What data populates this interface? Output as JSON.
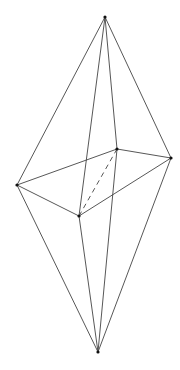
{
  "figure": {
    "type": "octahedron-wireframe",
    "stroke_color": "#444444",
    "vertex_color": "#111111",
    "vertices": {
      "top": [
        105,
        17
      ],
      "left": [
        17,
        185
      ],
      "back": [
        117,
        149
      ],
      "right": [
        171,
        158
      ],
      "front": [
        79,
        216
      ],
      "bottom": [
        98,
        352
      ]
    },
    "edges_visible": [
      [
        "top",
        "left"
      ],
      [
        "top",
        "back"
      ],
      [
        "top",
        "right"
      ],
      [
        "top",
        "front"
      ],
      [
        "bottom",
        "left"
      ],
      [
        "bottom",
        "back"
      ],
      [
        "bottom",
        "right"
      ],
      [
        "bottom",
        "front"
      ],
      [
        "left",
        "back"
      ],
      [
        "back",
        "right"
      ],
      [
        "right",
        "front"
      ],
      [
        "front",
        "left"
      ]
    ],
    "edges_hidden": [
      [
        "back",
        "front"
      ]
    ]
  }
}
